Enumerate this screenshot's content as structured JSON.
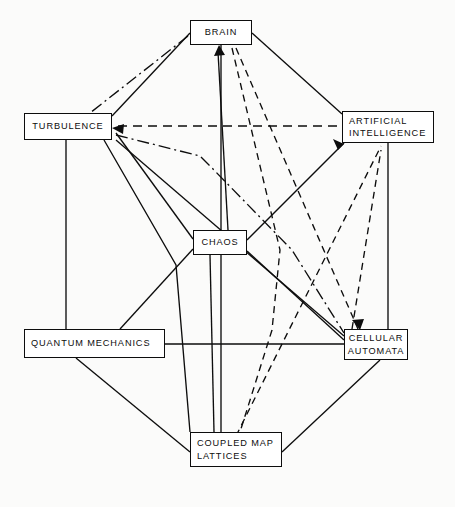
{
  "diagram": {
    "background_color": "#fbfbfa",
    "line_color": "#0d0d0d",
    "box_fill": "#ffffff",
    "width": 455,
    "height": 507,
    "nodes": [
      {
        "id": "brain",
        "label": "BRAIN",
        "lines": [
          "BRAIN"
        ],
        "align": "center",
        "x": 190,
        "y": 20,
        "w": 62,
        "h": 25
      },
      {
        "id": "turb",
        "label": "TURBULENCE",
        "lines": [
          "TURBULENCE"
        ],
        "align": "center",
        "x": 24,
        "y": 113,
        "w": 88,
        "h": 27
      },
      {
        "id": "ai",
        "label": "ARTIFICIAL INTELLIGENCE",
        "lines": [
          "ARTIFICIAL",
          "INTELLIGENCE"
        ],
        "align": "left",
        "x": 342,
        "y": 111,
        "w": 92,
        "h": 32
      },
      {
        "id": "chaos",
        "label": "CHAOS",
        "lines": [
          "CHAOS"
        ],
        "align": "center",
        "x": 193,
        "y": 230,
        "w": 54,
        "h": 25
      },
      {
        "id": "qm",
        "label": "QUANTUM MECHANICS",
        "lines": [
          "QUANTUM MECHANICS"
        ],
        "align": "left",
        "x": 24,
        "y": 329,
        "w": 141,
        "h": 29
      },
      {
        "id": "ca",
        "label": "CELLULAR AUTOMATA",
        "lines": [
          "CELLULAR",
          "AUTOMATA"
        ],
        "align": "center",
        "x": 344,
        "y": 329,
        "w": 64,
        "h": 31
      },
      {
        "id": "cml",
        "label": "COUPLED MAP LATTICES",
        "lines": [
          "COUPLED MAP",
          "LATTICES"
        ],
        "align": "left",
        "x": 190,
        "y": 432,
        "w": 92,
        "h": 35
      }
    ],
    "edges": [
      {
        "from": "turb",
        "to": "brain",
        "style": "solid",
        "arrow": "none"
      },
      {
        "from": "brain",
        "to": "ai",
        "style": "solid",
        "arrow": "none"
      },
      {
        "from": "turb",
        "to": "qm",
        "style": "solid",
        "arrow": "none"
      },
      {
        "from": "ai",
        "to": "ca",
        "style": "solid",
        "arrow": "none"
      },
      {
        "from": "brain",
        "to": "cml",
        "style": "solid",
        "arrow": "none"
      },
      {
        "from": "chaos",
        "to": "brain",
        "style": "solid",
        "arrow": "to-brain"
      },
      {
        "from": "chaos",
        "to": "turb",
        "style": "solid",
        "arrow": "to-turbulence"
      },
      {
        "from": "chaos",
        "to": "ai",
        "style": "solid",
        "arrow": "to-ai"
      },
      {
        "from": "chaos",
        "to": "qm",
        "style": "solid",
        "arrow": "none"
      },
      {
        "from": "chaos",
        "to": "ca",
        "style": "solid",
        "arrow": "none"
      },
      {
        "from": "chaos",
        "to": "cml",
        "style": "solid",
        "arrow": "none"
      },
      {
        "from": "qm",
        "to": "ca",
        "style": "solid",
        "arrow": "none"
      },
      {
        "from": "qm",
        "to": "cml",
        "style": "solid",
        "arrow": "none"
      },
      {
        "from": "ca",
        "to": "cml",
        "style": "solid",
        "arrow": "none"
      },
      {
        "from": "turb",
        "to": "cml",
        "style": "solid",
        "arrow": "none"
      },
      {
        "from": "brain",
        "to": "ca",
        "style": "dashed",
        "arrow": "to-ca"
      },
      {
        "from": "brain",
        "to": "cml",
        "style": "dashed",
        "arrow": "none"
      },
      {
        "from": "cml",
        "to": "ai",
        "style": "dashed",
        "arrow": "to-ai"
      },
      {
        "from": "ca",
        "to": "ai",
        "style": "dashed",
        "arrow": "to-ai"
      },
      {
        "from": "turb",
        "to": "ai",
        "style": "dashed",
        "arrow": "to-turbulence"
      },
      {
        "from": "brain",
        "to": "turb",
        "style": "dashdot",
        "arrow": "none"
      },
      {
        "from": "turb",
        "to": "ca",
        "style": "dashdot",
        "arrow": "to-turbulence"
      }
    ]
  }
}
